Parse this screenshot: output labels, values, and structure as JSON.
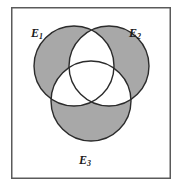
{
  "figure": {
    "type": "venn-diagram",
    "set_count": 3,
    "shaded_region_meaning": "elements belonging to exactly one event",
    "colors": {
      "shaded_fill": "#a8a8a8",
      "unshaded_fill": "#ffffff",
      "outline": "#2b2b2b",
      "frame_border": "#5a5a5a",
      "background": "#ffffff",
      "label_color": "#1a1a1a"
    },
    "frame": {
      "x": 11,
      "y": 7,
      "width": 160,
      "height": 172,
      "stroke_width": 1.5
    }
  },
  "circles": [
    {
      "id": "E1",
      "label_base": "E",
      "label_sub": "1",
      "cx": 74,
      "cy": 66,
      "r": 40,
      "label_x": 31,
      "label_y": 27
    },
    {
      "id": "E2",
      "label_base": "E",
      "label_sub": "2",
      "cx": 109,
      "cy": 66,
      "r": 40,
      "label_x": 129,
      "label_y": 27
    },
    {
      "id": "E3",
      "label_base": "E",
      "label_sub": "3",
      "cx": 91,
      "cy": 101,
      "r": 40,
      "label_x": 79,
      "label_y": 154
    }
  ],
  "labels": {
    "e1": {
      "base": "E",
      "sub": "1"
    },
    "e2": {
      "base": "E",
      "sub": "2"
    },
    "e3": {
      "base": "E",
      "sub": "3"
    }
  },
  "regions": [
    {
      "name": "E1-only",
      "shaded": true
    },
    {
      "name": "E2-only",
      "shaded": true
    },
    {
      "name": "E3-only",
      "shaded": true
    },
    {
      "name": "E1-and-E2",
      "shaded": false
    },
    {
      "name": "E1-and-E3",
      "shaded": false
    },
    {
      "name": "E2-and-E3",
      "shaded": false
    },
    {
      "name": "E1-and-E2-and-E3",
      "shaded": false
    }
  ]
}
